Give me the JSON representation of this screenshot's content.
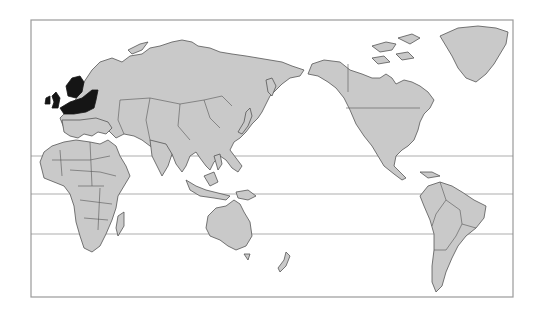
{
  "map": {
    "projection": "Pacific-centered world map",
    "frame": {
      "x": 31,
      "y": 20,
      "width": 482,
      "height": 277
    },
    "reference_lines": [
      {
        "name": "tropic-of-cancer",
        "y": 156
      },
      {
        "name": "equator",
        "y": 194
      },
      {
        "name": "tropic-of-capricorn",
        "y": 234
      }
    ],
    "colors": {
      "land": "#c9c9c9",
      "borders": "#555555",
      "highlight": "#151515",
      "ocean": "#ffffff",
      "frame": "#9a9a9a"
    },
    "highlighted_region": {
      "label": "Northern Europe",
      "areas": [
        "United Kingdom",
        "Ireland",
        "Norway",
        "Sweden",
        "Denmark",
        "Northern Germany",
        "Poland",
        "Baltic States"
      ]
    },
    "regions": [
      "Europe",
      "Asia",
      "Africa",
      "Australia",
      "North America",
      "South America",
      "Greenland",
      "New Zealand"
    ]
  }
}
